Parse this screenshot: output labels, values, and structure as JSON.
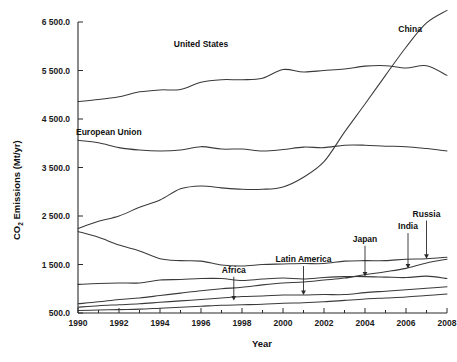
{
  "chart_data": {
    "type": "line",
    "title": "",
    "xlabel": "Year",
    "ylabel": "CO2 Emissions (Mt/yr)",
    "ylabel_parts": {
      "prefix": "CO",
      "subscript": "2",
      "suffix": " Emissions (Mt/yr)"
    },
    "grid": false,
    "legend_position": "inline-annotations",
    "xlim": [
      1990,
      2008
    ],
    "ylim": [
      500,
      6500
    ],
    "x": [
      1990,
      1991,
      1992,
      1993,
      1994,
      1995,
      1996,
      1997,
      1998,
      1999,
      2000,
      2001,
      2002,
      2003,
      2004,
      2005,
      2006,
      2007,
      2008
    ],
    "xticks": [
      1990,
      1992,
      1994,
      1996,
      1998,
      2000,
      2002,
      2004,
      2006,
      2008
    ],
    "xtick_labels": [
      "1990",
      "1992",
      "1994",
      "1996",
      "1998",
      "2000",
      "2002",
      "2004",
      "2006",
      "2008"
    ],
    "yticks": [
      500,
      1500,
      2500,
      3500,
      4500,
      5500,
      6500
    ],
    "ytick_labels": [
      "500.0",
      "1 500.0",
      "2 500.0",
      "3 500.0",
      "4 500.0",
      "5 500.0",
      "6 500.0"
    ],
    "series": [
      {
        "name": "United States",
        "label": "United States",
        "values": [
          4860,
          4900,
          4960,
          5060,
          5100,
          5110,
          5260,
          5310,
          5310,
          5340,
          5520,
          5470,
          5500,
          5530,
          5590,
          5600,
          5550,
          5600,
          5400
        ]
      },
      {
        "name": "China",
        "label": "China",
        "values": [
          2240,
          2390,
          2500,
          2680,
          2830,
          3060,
          3120,
          3080,
          3050,
          3050,
          3100,
          3300,
          3620,
          4230,
          4810,
          5400,
          5980,
          6480,
          6740
        ]
      },
      {
        "name": "European Union",
        "label": "European Union",
        "values": [
          4060,
          4010,
          3910,
          3860,
          3840,
          3860,
          3930,
          3880,
          3880,
          3840,
          3870,
          3920,
          3910,
          3960,
          3960,
          3940,
          3930,
          3890,
          3840
        ]
      },
      {
        "name": "Russia",
        "label": "Russia",
        "values": [
          2180,
          2060,
          1900,
          1780,
          1620,
          1580,
          1570,
          1490,
          1470,
          1500,
          1510,
          1520,
          1520,
          1570,
          1580,
          1580,
          1610,
          1620,
          1650
        ]
      },
      {
        "name": "India",
        "label": "India",
        "values": [
          690,
          730,
          780,
          810,
          860,
          910,
          960,
          1000,
          1030,
          1080,
          1120,
          1140,
          1180,
          1220,
          1290,
          1350,
          1420,
          1530,
          1610
        ]
      },
      {
        "name": "Japan",
        "label": "Japan",
        "values": [
          1090,
          1110,
          1120,
          1120,
          1180,
          1190,
          1210,
          1210,
          1170,
          1200,
          1220,
          1200,
          1230,
          1250,
          1250,
          1240,
          1230,
          1260,
          1210
        ]
      },
      {
        "name": "Latin America",
        "label": "Latin America",
        "values": [
          620,
          650,
          670,
          690,
          720,
          750,
          780,
          810,
          840,
          850,
          870,
          870,
          880,
          880,
          920,
          950,
          980,
          1010,
          1040
        ]
      },
      {
        "name": "Africa",
        "label": "Africa",
        "values": [
          550,
          560,
          570,
          580,
          600,
          620,
          640,
          660,
          670,
          680,
          700,
          710,
          730,
          760,
          790,
          810,
          830,
          860,
          890
        ]
      }
    ],
    "annotations": [
      {
        "label": "United States",
        "type": "inline",
        "x": 1996.0,
        "y": 5980
      },
      {
        "label": "China",
        "type": "inline",
        "x": 2006.2,
        "y": 6290
      },
      {
        "label": "European Union",
        "type": "inline",
        "x": 1991.5,
        "y": 4180
      },
      {
        "label": "Africa",
        "type": "arrow",
        "x": 1997.6,
        "y_text": 1330,
        "y_point": 760
      },
      {
        "label": "Latin America",
        "type": "arrow",
        "x": 2001.0,
        "y_text": 1550,
        "y_point": 870
      },
      {
        "label": "Japan",
        "type": "arrow",
        "x": 2004.0,
        "y_text": 1970,
        "y_point": 1250
      },
      {
        "label": "India",
        "type": "arrow",
        "x": 2006.1,
        "y_text": 2230,
        "y_point": 1420
      },
      {
        "label": "Russia",
        "type": "arrow",
        "x": 2007.0,
        "y_text": 2490,
        "y_point": 1620
      }
    ]
  },
  "colors": {
    "axis": "#2a2a2a",
    "line": "#3a3a3a",
    "text": "#111111",
    "background": "#ffffff"
  }
}
